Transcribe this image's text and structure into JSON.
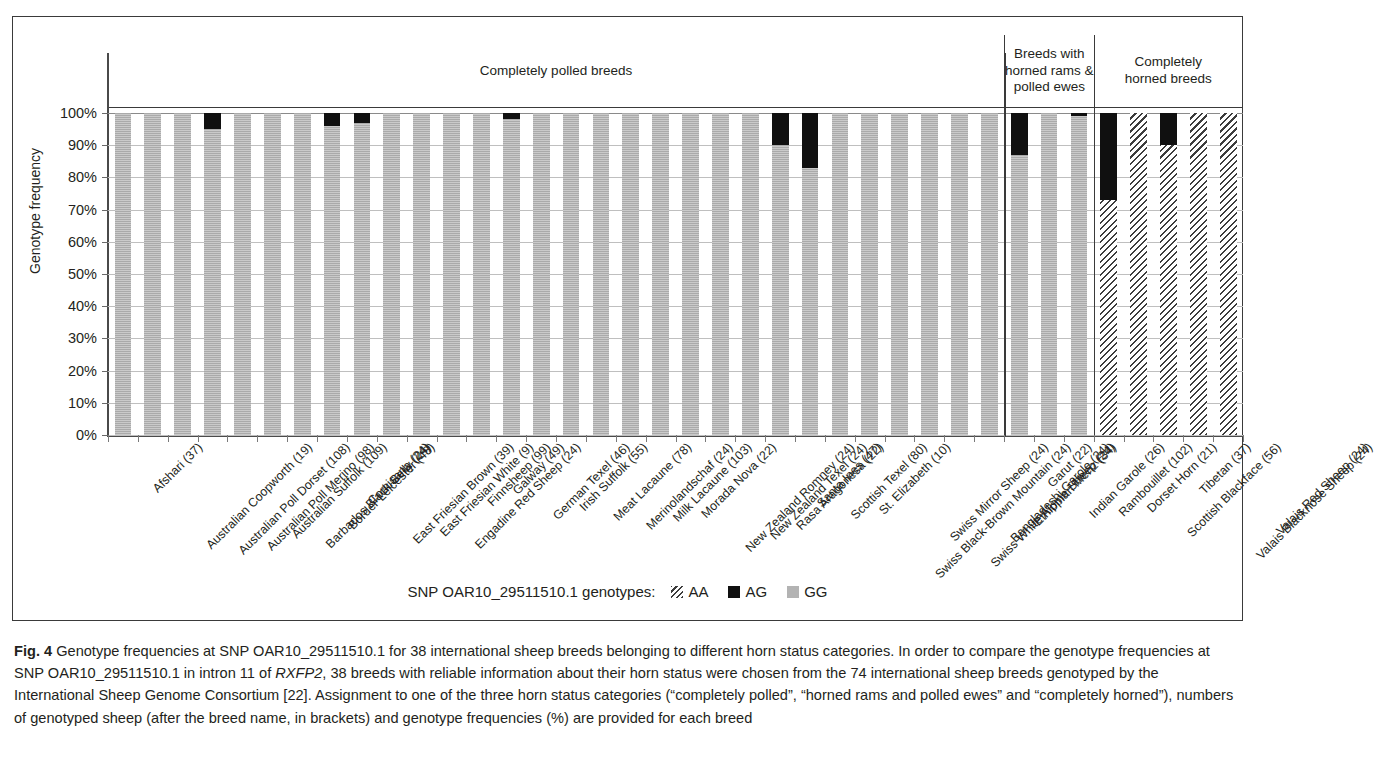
{
  "figure": {
    "label": "Fig. 4",
    "caption_part1": " Genotype frequencies at SNP OAR10_29511510.1 for 38 international sheep breeds belonging to different horn status categories. In order to compare the genotype frequencies at SNP OAR10_29511510.1 in intron 11 of ",
    "caption_italic": "RXFP2",
    "caption_part2": ", 38 breeds with reliable information about their horn status were chosen from the 74 international sheep breeds genotyped by the International Sheep Genome Consortium [22]. Assignment to one of the three horn status categories (“completely polled”, “horned rams and polled ewes” and “completely horned”), numbers of genotyped sheep (after the breed name, in brackets) and genotype frequencies (%) are provided for each breed"
  },
  "legend": {
    "title": "SNP OAR10_29511510.1 genotypes:",
    "items": [
      {
        "name": "AA",
        "swatch": "hatched",
        "color": "#3c3c3c"
      },
      {
        "name": "AG",
        "swatch": "solid",
        "color": "#101010"
      },
      {
        "name": "GG",
        "swatch": "solid",
        "color": "#b3b3b3"
      }
    ]
  },
  "groups": [
    {
      "label": "Completely polled breeds",
      "count": 30
    },
    {
      "label": "Breeds with\nhorned rams &\npolled ewes",
      "count": 3
    },
    {
      "label": "Completely\nhorned breeds",
      "count": 5
    }
  ],
  "group_labels": {
    "g0": "Completely polled breeds",
    "g1_l1": "Breeds with",
    "g1_l2": "horned rams &",
    "g1_l3": "polled ewes",
    "g2_l1": "Completely",
    "g2_l2": "horned breeds"
  },
  "chart_data": {
    "type": "bar",
    "subtype": "stacked-vertical",
    "title": "",
    "xlabel": "",
    "ylabel": "Genotype frequency",
    "ylim": [
      0,
      100
    ],
    "yticks": [
      "0%",
      "10%",
      "20%",
      "30%",
      "40%",
      "50%",
      "60%",
      "70%",
      "80%",
      "90%",
      "100%"
    ],
    "ytick_values": [
      0,
      10,
      20,
      30,
      40,
      50,
      60,
      70,
      80,
      90,
      100
    ],
    "grid": true,
    "legend_position": "bottom",
    "series": [
      {
        "name": "AA",
        "style": "hatched",
        "color": "#3c3c3c",
        "values": [
          0,
          0,
          0,
          0,
          0,
          0,
          0,
          0,
          0,
          0,
          0,
          0,
          0,
          0,
          0,
          0,
          0,
          0,
          0,
          0,
          0,
          0,
          0,
          0,
          0,
          0,
          0,
          0,
          0,
          0,
          0,
          0,
          0,
          73,
          100,
          90,
          100,
          100
        ]
      },
      {
        "name": "AG",
        "style": "solid",
        "color": "#101010",
        "values": [
          0,
          0,
          0,
          5,
          0,
          0,
          0,
          4,
          3,
          0,
          0,
          0,
          0,
          2,
          0,
          0,
          0,
          0,
          0,
          0,
          0,
          0,
          10,
          17,
          0,
          0,
          0,
          0,
          0,
          0,
          13,
          0,
          1,
          27,
          0,
          10,
          0,
          0
        ]
      },
      {
        "name": "GG",
        "style": "solid",
        "color": "#b3b3b3",
        "values": [
          100,
          100,
          100,
          95,
          100,
          100,
          100,
          96,
          97,
          100,
          100,
          100,
          100,
          98,
          100,
          100,
          100,
          100,
          100,
          100,
          100,
          100,
          90,
          83,
          100,
          100,
          100,
          100,
          100,
          100,
          87,
          100,
          99,
          0,
          0,
          0,
          0,
          0
        ]
      }
    ],
    "categories": [
      "Afshari (37)",
      "Australian Coopworth (19)",
      "Australian Poll Dorset (108)",
      "Australian Poll Merino (98)",
      "Australian Suffolk (109)",
      "Barbados Black Belly (24)",
      "Border Leicester (48)",
      "Comisana (24)",
      "East Friesian Brown (39)",
      "East Friesian White (9)",
      "Engadine Red Sheep (24)",
      "Finnsheep (99)",
      "Galway (49)",
      "German Texel (46)",
      "Irish Suffolk (55)",
      "Meat Lacaune (78)",
      "Merinolandschaf (24)",
      "Milk Lacaune (103)",
      "Morada Nova (22)",
      "New Zealand Romney (24)",
      "New Zealand Texel (24)",
      "Rasa Aragonesa (22)",
      "Santa Ines (47)",
      "Scottish Texel (80)",
      "St. Elizabeth (10)",
      "Swiss Black-Brown Mountain (24)",
      "Swiss Mirror Sheep (24)",
      "Swiss White Alpine Sheep (24)",
      "Bangladeshi Garole (24)",
      "Ethiopian Menz (34)",
      "Garut (22)",
      "Indian Garole (26)",
      "Rambouillet (102)",
      "Dorset Horn (21)",
      "Scottish Blackface (56)",
      "Tibetan (37)",
      "Valais Blacknose Sheep (24)",
      "Valais Red Sheep (24)"
    ]
  }
}
